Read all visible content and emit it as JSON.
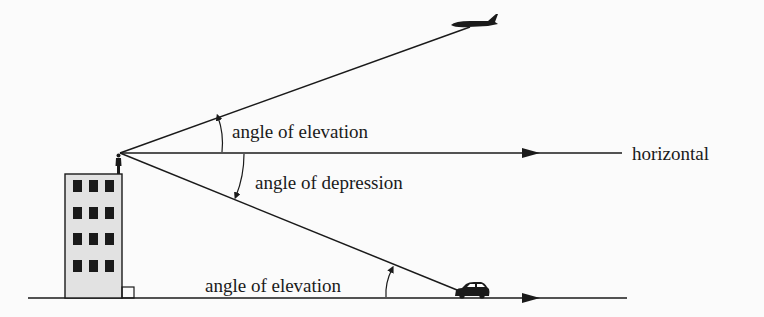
{
  "figure": {
    "labels": {
      "upper_elevation": "angle of elevation",
      "depression": "angle of depression",
      "lower_elevation": "angle of elevation",
      "horizontal": "horizontal"
    },
    "objects": {
      "observer": "person-on-building",
      "building": "building",
      "aircraft": "airplane",
      "vehicle": "car"
    },
    "building": {
      "window_rows": 4,
      "window_cols": 3
    },
    "colors": {
      "line": "#1a1a1a",
      "building_fill": "#e2e2e2",
      "window_fill": "#1a1a1a",
      "background": "#fbfbfb"
    }
  }
}
